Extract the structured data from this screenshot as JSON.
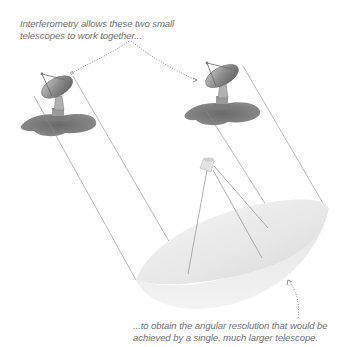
{
  "captions": {
    "top": {
      "line1": "Interferometry allows these two small",
      "line2": "telescopes to work together..."
    },
    "bottom": {
      "line1": "...to obtain the angular resolution that would be",
      "line2": "achieved by a single, much larger telescope."
    }
  },
  "elements": {
    "small_telescope_left": "radio dish (small)",
    "small_telescope_right": "radio dish (small)",
    "large_telescope": "large dish (virtual)"
  },
  "colors": {
    "text": "#6f6f6f",
    "lines": "#8a8a8a",
    "dotted_arrow": "#7a7a7a",
    "shadow": "#707070",
    "big_dish_light": "#f2f2f2",
    "big_dish_dark": "#dcdcdc"
  }
}
